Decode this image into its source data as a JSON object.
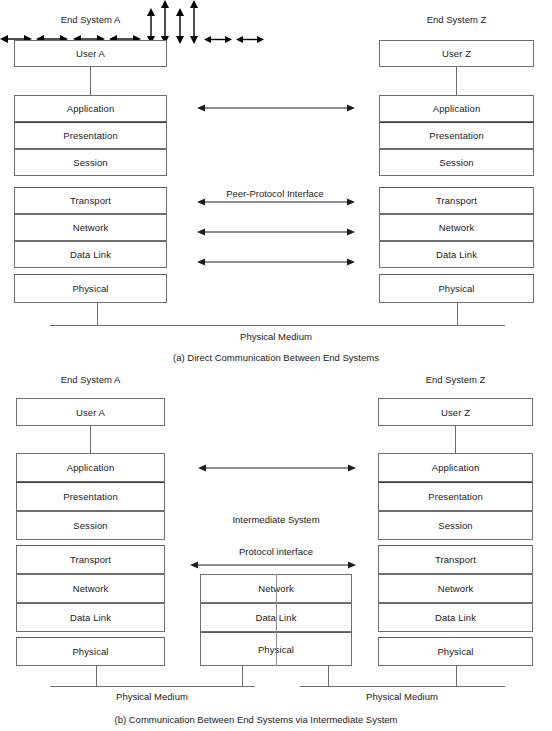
{
  "figure": {
    "title_a": "(a) Direct Communication Between End Systems",
    "title_b": "(b)  Communication Between End Systems via Intermediate System"
  },
  "part_a": {
    "left_system_label": "End System A",
    "right_system_label": "End System Z",
    "left_user_label": "User A",
    "right_user_label": "User Z",
    "peer_protocol_label": "Peer-Protocol Interface",
    "physical_medium_label": "Physical Medium",
    "layers": [
      "Application",
      "Presentation",
      "Session",
      "Transport",
      "Network",
      "Data Link",
      "Physical"
    ],
    "arrow_layers": [
      "Application",
      "Transport",
      "Network",
      "Data Link"
    ]
  },
  "part_b": {
    "left_system_label": "End System A",
    "right_system_label": "End System Z",
    "left_user_label": "User A",
    "right_user_label": "User Z",
    "intermediate_system_label": "Intermediate System",
    "protocol_interface_label": "Protocol interface",
    "physical_medium_label_left": "Physical Medium",
    "physical_medium_label_right": "Physical Medium",
    "layers": [
      "Application",
      "Presentation",
      "Session",
      "Transport",
      "Network",
      "Data Link",
      "Physical"
    ],
    "intermediate_layers": [
      "Network",
      "Data Link",
      "Physical"
    ],
    "arrow_layers": [
      "Application"
    ]
  },
  "colors": {
    "stroke": "#6f6f6f",
    "arrow": "#1d1d1d",
    "text": "#1b1b1b",
    "background": "#ffffff"
  }
}
